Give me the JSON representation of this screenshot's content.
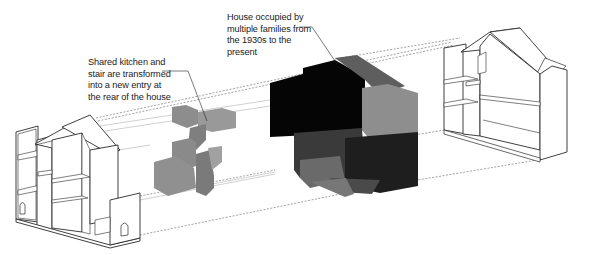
{
  "diagram": {
    "type": "exploded axonometric architectural diagram",
    "annotations": [
      {
        "id": "rear-entry",
        "text": "Shared kitchen and\nstair are transformed\ninto a new entry at\nthe rear of the house"
      },
      {
        "id": "occupied-house",
        "text": "House occupied by\nmultiple families from\nthe 1930s to the\npresent"
      }
    ],
    "elements": [
      {
        "id": "left-house",
        "description": "Sectioned house model (white, outlined) at left"
      },
      {
        "id": "stair-kitchen-volume",
        "description": "Gray stair/kitchen massing"
      },
      {
        "id": "occupied-volume",
        "description": "Black/dark gray house massing"
      },
      {
        "id": "right-house",
        "description": "Sectioned house model (white, outlined) at right"
      }
    ],
    "colors": {
      "line": "#333333",
      "dashed": "#777777",
      "stair_gray": "#8a8a8a",
      "mass_black": "#050505",
      "mass_dark": "#2b2b2b",
      "mass_mid": "#5a5a5a",
      "mass_light": "#8c8c8c"
    }
  }
}
